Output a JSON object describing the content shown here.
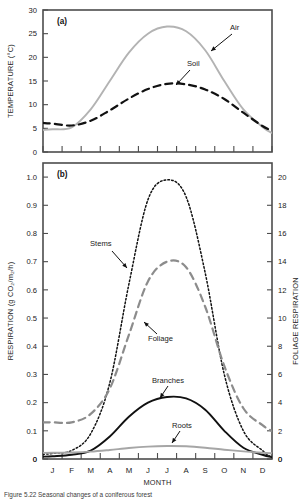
{
  "figure": {
    "caption": "Figure 5.22   Seasonal changes of a coniferous forest",
    "panel_a_id": "(a)",
    "panel_b_id": "(b)"
  },
  "chart_data": [
    {
      "type": "line",
      "panel": "(a)",
      "title": "",
      "xlabel": "",
      "ylabel": "TEMPERATURE (°C)",
      "ylim": [
        0,
        30
      ],
      "yticks": [
        0,
        5,
        10,
        15,
        20,
        25,
        30
      ],
      "ytick_labels": [
        "0",
        "5",
        "10",
        "15",
        "20",
        "25",
        "30"
      ],
      "categories": [
        "J",
        "F",
        "M",
        "A",
        "M",
        "J",
        "J",
        "A",
        "S",
        "O",
        "N",
        "D"
      ],
      "grid": false,
      "legend": "inline-annotations",
      "series": [
        {
          "name": "Air",
          "style": "solid",
          "color": "#b3b3b3",
          "values": [
            4.8,
            5.2,
            9.0,
            15.0,
            21.0,
            25.0,
            26.5,
            25.5,
            21.5,
            15.0,
            9.0,
            5.3
          ]
        },
        {
          "name": "Soil",
          "style": "dashed",
          "color": "#111111",
          "values": [
            6.0,
            5.6,
            6.6,
            8.8,
            11.3,
            13.3,
            14.4,
            14.3,
            13.2,
            11.2,
            8.3,
            5.5
          ]
        }
      ]
    },
    {
      "type": "line",
      "panel": "(b)",
      "title": "",
      "xlabel": "MONTH",
      "ylabel": "RESPIRATION (g CO₂/m₂/h)",
      "ylabel_right": "FOLIAGE RESPIRATION",
      "ylim": [
        0,
        1.05
      ],
      "yticks": [
        0,
        0.1,
        0.2,
        0.3,
        0.4,
        0.5,
        0.6,
        0.7,
        0.8,
        0.9,
        1.0
      ],
      "ytick_labels": [
        "0",
        "0.1",
        "0.2",
        "0.3",
        "0.4",
        "0.5",
        "0.6",
        "0.7",
        "0.8",
        "0.9",
        "1.0"
      ],
      "ylim_right": [
        0,
        21
      ],
      "yticks_right": [
        0,
        2,
        4,
        6,
        8,
        10,
        12,
        14,
        16,
        18,
        20
      ],
      "ytick_labels_right": [
        "0",
        "2",
        "4",
        "6",
        "8",
        "10",
        "12",
        "14",
        "16",
        "18",
        "20"
      ],
      "categories": [
        "J",
        "F",
        "M",
        "A",
        "M",
        "J",
        "J",
        "A",
        "S",
        "O",
        "N",
        "D"
      ],
      "grid": false,
      "legend": "inline-annotations",
      "series": [
        {
          "name": "Stems",
          "style": "dotted",
          "color": "#111111",
          "axis": "left",
          "values": [
            0.02,
            0.03,
            0.09,
            0.27,
            0.62,
            0.92,
            0.99,
            0.93,
            0.66,
            0.3,
            0.1,
            0.03
          ]
        },
        {
          "name": "Foliage",
          "style": "dashed",
          "color": "#8c8c8c",
          "axis": "right",
          "values": [
            0.13,
            0.13,
            0.16,
            0.25,
            0.44,
            0.63,
            0.7,
            0.68,
            0.54,
            0.33,
            0.18,
            0.12
          ]
        },
        {
          "name": "Branches",
          "style": "solid",
          "color": "#111111",
          "axis": "left",
          "values": [
            0.01,
            0.015,
            0.03,
            0.08,
            0.15,
            0.2,
            0.22,
            0.215,
            0.175,
            0.1,
            0.04,
            0.015
          ]
        },
        {
          "name": "Roots",
          "style": "solid",
          "color": "#a6a6a6",
          "axis": "left",
          "values": [
            0.022,
            0.023,
            0.026,
            0.032,
            0.039,
            0.044,
            0.046,
            0.045,
            0.04,
            0.033,
            0.027,
            0.022
          ]
        }
      ],
      "annotations": [
        {
          "text": "Stems",
          "x": 90,
          "y": 246
        },
        {
          "text": "Foliage",
          "x": 148,
          "y": 341
        },
        {
          "text": "Branches",
          "x": 152,
          "y": 383
        },
        {
          "text": "Roots",
          "x": 172,
          "y": 428
        }
      ]
    }
  ],
  "panel_a_annotations": [
    {
      "text": "Air",
      "x": 230,
      "y": 30
    },
    {
      "text": "Soil",
      "x": 187,
      "y": 66
    }
  ],
  "axes_text": {
    "temperature_label": "TEMPERATURE (°C)",
    "respiration_label": "RESPIRATION (g CO₂/m₂/h)",
    "foliage_label": "FOLIAGE RESPIRATION",
    "month_label": "MONTH",
    "zero_left": "0",
    "zero_right": "0"
  }
}
